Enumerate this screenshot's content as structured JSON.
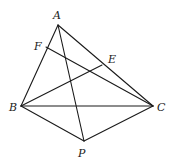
{
  "diagram": {
    "type": "geometry-figure",
    "points": {
      "A": {
        "label": "A",
        "x": 58,
        "y": 25,
        "lx": 53,
        "ly": 19
      },
      "F": {
        "label": "F",
        "x": 46,
        "y": 47,
        "lx": 34,
        "ly": 50
      },
      "E": {
        "label": "E",
        "x": 102,
        "y": 65,
        "lx": 108,
        "ly": 63
      },
      "B": {
        "label": "B",
        "x": 21,
        "y": 106,
        "lx": 9,
        "ly": 111
      },
      "C": {
        "label": "C",
        "x": 153,
        "y": 106,
        "lx": 157,
        "ly": 111
      },
      "P": {
        "label": "P",
        "x": 84,
        "y": 141,
        "lx": 78,
        "ly": 157
      }
    },
    "segments": [
      [
        "A",
        "B"
      ],
      [
        "A",
        "C"
      ],
      [
        "A",
        "P"
      ],
      [
        "B",
        "C"
      ],
      [
        "B",
        "P"
      ],
      [
        "C",
        "P"
      ],
      [
        "B",
        "E"
      ],
      [
        "C",
        "F"
      ]
    ],
    "colors": {
      "stroke": "#1a1a1a",
      "background": "#ffffff"
    }
  }
}
